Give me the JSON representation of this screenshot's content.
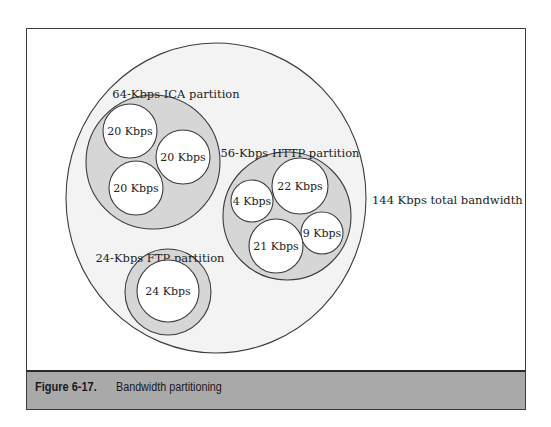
{
  "figure": {
    "number": "Figure 6-17.",
    "title": "Bandwidth partitioning"
  },
  "colors": {
    "frame_border": "#3a3a3a",
    "total_fill": "#f3f3f3",
    "partition_fill": "#d6d6d6",
    "flow_fill": "#ffffff",
    "stroke": "#3c3c3c",
    "caption_bg": "#a9a9a9"
  },
  "total": {
    "label": "144 Kbps total bandwidth",
    "bandwidth_kbps": 144,
    "shape": {
      "cx": 216,
      "cy": 198,
      "rx": 150,
      "ry": 155
    },
    "label_pos": {
      "x": 372,
      "y": 204
    }
  },
  "partitions": [
    {
      "id": "ica",
      "label": "64-Kbps ICA partition",
      "bandwidth_kbps": 64,
      "shape": {
        "cx": 153,
        "cy": 162,
        "r": 67
      },
      "label_pos": {
        "x": 176,
        "y": 98
      },
      "flows": [
        {
          "label": "20 Kbps",
          "bandwidth_kbps": 20,
          "cx": 130,
          "cy": 131,
          "r": 27
        },
        {
          "label": "20 Kbps",
          "bandwidth_kbps": 20,
          "cx": 183,
          "cy": 157,
          "r": 27
        },
        {
          "label": "20 Kbps",
          "bandwidth_kbps": 20,
          "cx": 136,
          "cy": 188,
          "r": 27
        }
      ]
    },
    {
      "id": "http",
      "label": "56-Kbps HTTP partition",
      "bandwidth_kbps": 56,
      "shape": {
        "cx": 287,
        "cy": 216,
        "r": 64
      },
      "label_pos": {
        "x": 290,
        "y": 157
      },
      "flows": [
        {
          "label": "4 Kbps",
          "bandwidth_kbps": 4,
          "cx": 252,
          "cy": 201,
          "r": 21
        },
        {
          "label": "22 Kbps",
          "bandwidth_kbps": 22,
          "cx": 300,
          "cy": 186,
          "r": 28
        },
        {
          "label": "9 Kbps",
          "bandwidth_kbps": 9,
          "cx": 322,
          "cy": 233,
          "r": 21
        },
        {
          "label": "21 Kbps",
          "bandwidth_kbps": 21,
          "cx": 276,
          "cy": 246,
          "r": 27
        }
      ]
    },
    {
      "id": "ftp",
      "label": "24-Kbps FTP partition",
      "bandwidth_kbps": 24,
      "shape": {
        "cx": 168,
        "cy": 292,
        "r": 43
      },
      "label_pos": {
        "x": 160,
        "y": 262
      },
      "flows": [
        {
          "label": "24 Kbps",
          "bandwidth_kbps": 24,
          "cx": 168,
          "cy": 291,
          "r": 31
        }
      ]
    }
  ]
}
